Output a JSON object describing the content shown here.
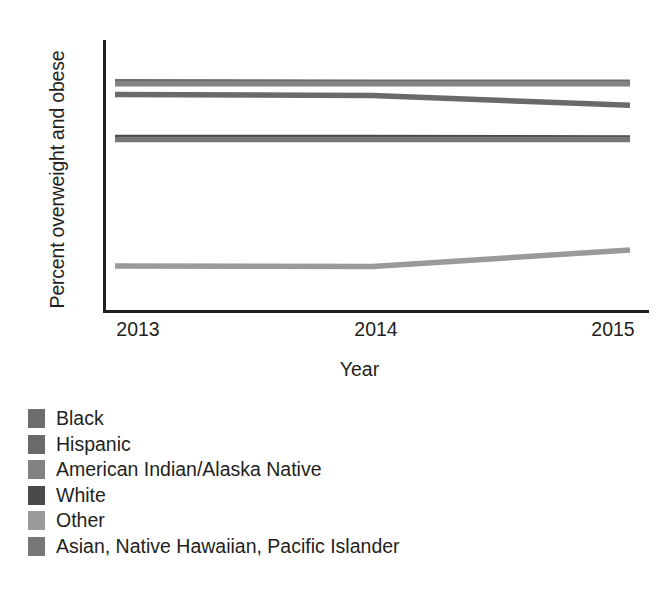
{
  "chart_data": {
    "type": "line",
    "title": "",
    "xlabel": "Year",
    "ylabel": "Percent overweight and obese",
    "x": [
      2013,
      2014,
      2015
    ],
    "xticklabels": [
      "2013",
      "2014",
      "2015"
    ],
    "yticklabels": [
      "30",
      "40",
      "50",
      "60",
      "70",
      "80"
    ],
    "yticks": [
      30,
      40,
      50,
      60,
      70,
      80
    ],
    "ylim": [
      30,
      80
    ],
    "xlim": [
      2013,
      2015
    ],
    "grid": false,
    "legend_position": "below-plot-left",
    "series": [
      {
        "name": "Black",
        "values": [
          72.6,
          72.5,
          72.5
        ],
        "color": "#6d6d6d"
      },
      {
        "name": "Hispanic",
        "values": [
          70.2,
          70.0,
          68.2
        ],
        "color": "#6a6a6a"
      },
      {
        "name": "American Indian/Alaska Native",
        "values": [
          72.2,
          72.2,
          72.2
        ],
        "color": "#828282"
      },
      {
        "name": "White",
        "values": [
          62.2,
          62.2,
          62.1
        ],
        "color": "#4a4a4a"
      },
      {
        "name": "Other",
        "values": [
          38.2,
          38.1,
          41.2
        ],
        "color": "#9a9a9a"
      },
      {
        "name": "Asian, Native Hawaiian, Pacific Islander",
        "values": [
          61.8,
          61.8,
          61.8
        ],
        "color": "#777777"
      }
    ]
  },
  "axes": {
    "y_title": "Percent overweight and obese",
    "x_title": "Year",
    "y_ticks": [
      "80",
      "70",
      "60",
      "50",
      "40",
      "30"
    ],
    "x_ticks": [
      "2013",
      "2014",
      "2015"
    ]
  },
  "legend": {
    "items": [
      {
        "label": "Black",
        "color": "#6d6d6d"
      },
      {
        "label": "Hispanic",
        "color": "#6a6a6a"
      },
      {
        "label": "American Indian/Alaska Native",
        "color": "#828282"
      },
      {
        "label": "White",
        "color": "#4a4a4a"
      },
      {
        "label": "Other",
        "color": "#9a9a9a"
      },
      {
        "label": "Asian, Native Hawaiian, Pacific Islander",
        "color": "#777777"
      }
    ]
  },
  "colors": {
    "axis": "#231f20",
    "text": "#231f20",
    "background": "#ffffff"
  }
}
